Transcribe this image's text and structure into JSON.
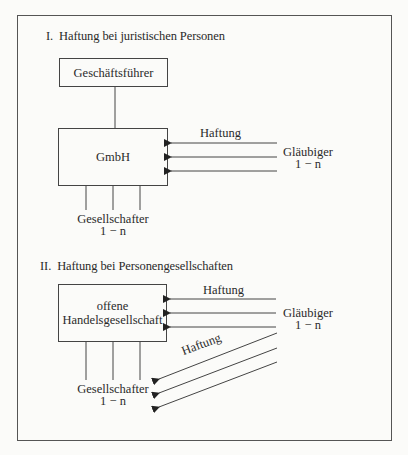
{
  "diagram": {
    "section_1": {
      "number": "I.",
      "title": "Haftung bei juristischen Personen",
      "manager_box": "Geschäftsführer",
      "entity_box": "GmbH",
      "liability_label": "Haftung",
      "creditors": {
        "label": "Gläubiger",
        "count": "1 − n"
      },
      "shareholders": {
        "label": "Gesellschafter",
        "count": "1 − n"
      }
    },
    "section_2": {
      "number": "II.",
      "title": "Haftung bei Personengesellschaften",
      "entity_box_line1": "offene",
      "entity_box_line2": "Handelsgesellschaft",
      "liability_label": "Haftung",
      "liability_label_diagonal": "Haftung",
      "creditors": {
        "label": "Gläubiger",
        "count": "1 − n"
      },
      "shareholders": {
        "label": "Gesellschafter",
        "count": "1 − n"
      }
    },
    "colors": {
      "line": "#444444",
      "text": "#2a2a2a",
      "background": "#fbfbf9"
    }
  }
}
